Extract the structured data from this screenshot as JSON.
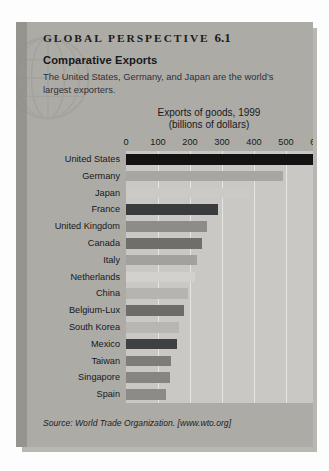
{
  "panel": {
    "kicker_text": "GLOBAL PERSPECTIVE",
    "kicker_number": "6.1",
    "subhead": "Comparative Exports",
    "blurb": "The United States, Germany, and Japan are the world's largest exporters.",
    "source": "Source: World Trade Organization. [www.wto.org]"
  },
  "colors": {
    "panel_bg": "#adaba6",
    "panel_leftband": "#96948f",
    "plot_bg": "#c9c8c4",
    "gridline": "#eceae6",
    "text": "#16181c",
    "shadow": "#b9b7b2"
  },
  "chart_data": {
    "type": "bar",
    "orientation": "horizontal",
    "title": "Exports of goods, 1999",
    "subtitle": "(billions of dollars)",
    "xlabel": "",
    "ylabel": "",
    "xlim": [
      0,
      600
    ],
    "grid": true,
    "legend": "none",
    "tick_labels": [
      "0",
      "100",
      "200",
      "300",
      "400",
      "500",
      "600"
    ],
    "tick_values": [
      0,
      100,
      200,
      300,
      400,
      500,
      600
    ],
    "categories": [
      "United States",
      "Germany",
      "Japan",
      "France",
      "United Kingdom",
      "Canada",
      "Italy",
      "Netherlands",
      "China",
      "Belgium-Lux",
      "South Korea",
      "Mexico",
      "Taiwan",
      "Singapore",
      "Spain"
    ],
    "values": [
      595,
      492,
      388,
      287,
      252,
      237,
      221,
      215,
      195,
      180,
      167,
      158,
      142,
      136,
      126
    ],
    "bar_colors": [
      "#131313",
      "#a7a6a2",
      "#cbcac6",
      "#3a3b3d",
      "#8d8c88",
      "#6f6e6b",
      "#a2a19d",
      "#d2d1cd",
      "#b5b4b0",
      "#6d6c69",
      "#b7b6b2",
      "#3f4042",
      "#7d7c79",
      "#86857f",
      "#8c8b86"
    ]
  }
}
